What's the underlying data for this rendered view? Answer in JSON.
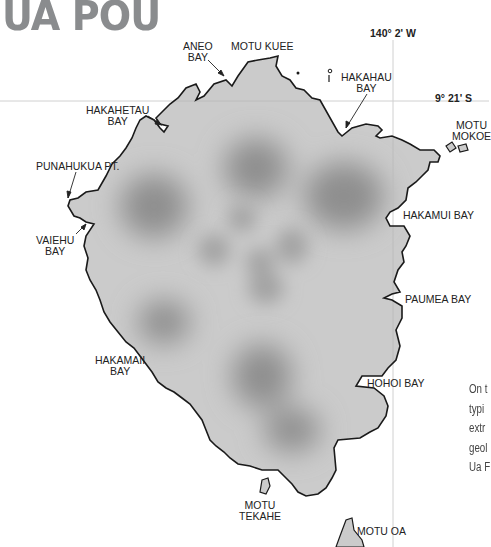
{
  "title": "UA POU",
  "coordinates": {
    "longitude": "140° 2' W",
    "latitude": "9° 21' S"
  },
  "labels": {
    "aneo_bay": [
      "ANEO",
      "BAY"
    ],
    "motu_kuee": "MOTU KUEE",
    "hakahau_bay": [
      "HAKAHAU",
      "BAY"
    ],
    "motu_mokoe": [
      "MOTU",
      "MOKOE"
    ],
    "hakahetau_bay": [
      "HAKAHETAU",
      "BAY"
    ],
    "punahukua_pt": "PUNAHUKUA PT.",
    "vaiehu_bay": [
      "VAIEHU",
      "BAY"
    ],
    "hakamui_bay": "HAKAMUI BAY",
    "paumea_bay": "PAUMEA BAY",
    "hakamaii_bay": [
      "HAKAMAII",
      "BAY"
    ],
    "hohoi_bay": "HOHOI BAY",
    "motu_tekahe": [
      "MOTU",
      "TEKAHE"
    ],
    "motu_oa": "MOTU OA"
  },
  "side_text_lines": [
    "On t",
    "typi",
    "extr",
    "geol",
    "Ua F"
  ],
  "colors": {
    "land": "#c9c9c9",
    "land_dark": "#8f8f8f",
    "coast": "#1a1a1a",
    "grid": "#cfcfcf",
    "title": "#8a8c8e"
  }
}
